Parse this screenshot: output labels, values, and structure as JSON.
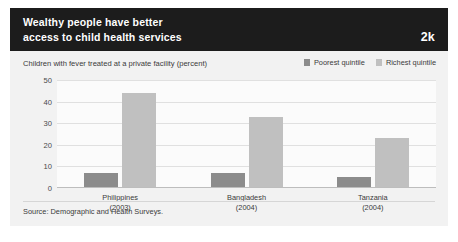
{
  "header": {
    "title": "Wealthy people have better\naccess to child health services",
    "chapter_badge": "2k"
  },
  "footer": {
    "source": "Source: Demographic and Health Surveys."
  },
  "colors": {
    "header_background": "#1c1c1c",
    "card_background": "#f2f2f2",
    "plot_background": "#fbfbfb",
    "poorest": "#8c8c8c",
    "richest": "#c0c0c0",
    "gridline": "#e0e0e0",
    "text": "#3a3a3a"
  },
  "chart_data": {
    "type": "bar",
    "title": "Children with fever treated at a private facility (percent)",
    "xlabel": "",
    "ylabel": "",
    "ylim": [
      0,
      50
    ],
    "yticks": [
      50,
      40,
      30,
      20,
      10,
      0
    ],
    "grid": true,
    "legend_position": "top-right",
    "categories": [
      "Philippines\n(2003)",
      "Bangladesh\n(2004)",
      "Tanzania\n(2004)"
    ],
    "series": [
      {
        "name": "Poorest quintile",
        "color": "#8c8c8c",
        "values": [
          7,
          7,
          5
        ]
      },
      {
        "name": "Richest quintile",
        "color": "#c0c0c0",
        "values": [
          44,
          33,
          23
        ]
      }
    ]
  }
}
